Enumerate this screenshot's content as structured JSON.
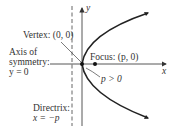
{
  "diagram": {
    "axes": {
      "x_label": "x",
      "y_label": "y"
    },
    "vertex_label": "Vertex: (0, 0)",
    "focus_label": "Focus: (p, 0)",
    "p_label": "p > 0",
    "axis_of_symmetry": {
      "line1": "Axis of",
      "line2": "symmetry:",
      "line3": "y = 0"
    },
    "directrix": {
      "line1": "Directrix:",
      "line2": "x = −p"
    },
    "colors": {
      "curve": "#222222",
      "axis": "#444444"
    }
  }
}
